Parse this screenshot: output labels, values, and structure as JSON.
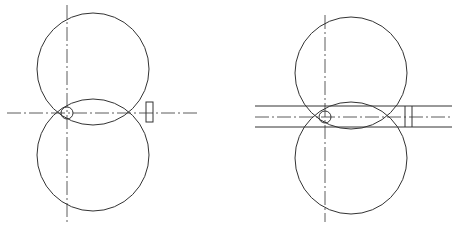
{
  "figure": {
    "width": 457,
    "height": 228,
    "stroke_color": "#333333",
    "background": "#ffffff",
    "panels": [
      {
        "id": "left",
        "description": "two tangent-overlapping rolls with centerlines, small circle at origin and rectangular marker",
        "top_circle": {
          "cx": 93,
          "cy": 69,
          "r": 56
        },
        "bottom_circle": {
          "cx": 93,
          "cy": 155,
          "r": 56
        },
        "small_circle": {
          "cx": 67,
          "cy": 113,
          "r": 6
        },
        "v_centerline": {
          "x": 67,
          "y1": 5,
          "y2": 222
        },
        "h_centerline": {
          "y": 113,
          "x1": 7,
          "x2": 199
        },
        "rect_marker": {
          "x": 146,
          "y": 102,
          "w": 7,
          "h": 20
        }
      },
      {
        "id": "right",
        "description": "two overlapping rolls with strip band between parallel lines, centerlines, small circle and double vertical marker",
        "top_circle": {
          "cx": 351,
          "cy": 73,
          "r": 56
        },
        "bottom_circle": {
          "cx": 351,
          "cy": 158,
          "r": 56
        },
        "small_circle": {
          "cx": 325,
          "cy": 117,
          "r": 6
        },
        "v_centerline": {
          "x": 325,
          "y1": 15,
          "y2": 222
        },
        "h_centerline": {
          "y": 117,
          "x1": 255,
          "x2": 452
        },
        "band": {
          "y_top": 106,
          "y_bottom": 127,
          "x1": 255,
          "x2": 452
        },
        "marker_lines": [
          405,
          412
        ]
      }
    ]
  }
}
